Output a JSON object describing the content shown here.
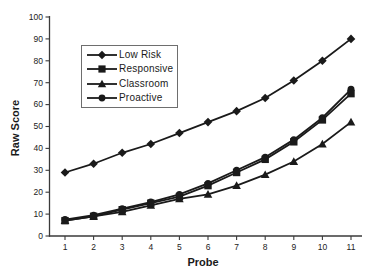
{
  "figure": {
    "background": "#ffffff",
    "ink": "#1a1a1a",
    "axis_color": "#3a3a3a"
  },
  "chart_data": {
    "type": "line",
    "title": "",
    "xlabel": "Probe",
    "ylabel": "Raw Score",
    "x": [
      1,
      2,
      3,
      4,
      5,
      6,
      7,
      8,
      9,
      10,
      11
    ],
    "x_tick_labels": [
      "1",
      "2",
      "3",
      "4",
      "5",
      "6",
      "7",
      "8",
      "9",
      "10",
      "11"
    ],
    "y_ticks": [
      0,
      10,
      20,
      30,
      40,
      50,
      60,
      70,
      80,
      90,
      100
    ],
    "xlim": [
      0.5,
      11.5
    ],
    "ylim": [
      0,
      100
    ],
    "grid": false,
    "legend_position": "upper-left-inside",
    "line_color": "#1a1a1a",
    "series": [
      {
        "name": "Low Risk",
        "marker": "diamond",
        "values": [
          29,
          33,
          38,
          42,
          47,
          52,
          57,
          63,
          71,
          80,
          90
        ]
      },
      {
        "name": "Responsive",
        "marker": "square",
        "values": [
          7,
          9,
          12,
          15,
          18,
          23,
          29,
          35,
          43,
          53,
          65
        ]
      },
      {
        "name": "Classroom",
        "marker": "triangle",
        "values": [
          7,
          9,
          11,
          14,
          17,
          19,
          23,
          28,
          34,
          42,
          52
        ]
      },
      {
        "name": "Proactive",
        "marker": "circle",
        "values": [
          7.5,
          9.5,
          12.5,
          15.5,
          19,
          24,
          30,
          36,
          44,
          54,
          67
        ]
      }
    ]
  }
}
